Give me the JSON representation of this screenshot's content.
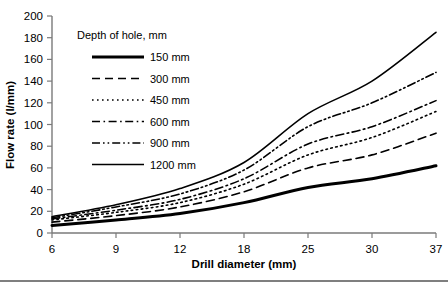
{
  "chart_data": {
    "type": "line",
    "title": "",
    "xlabel": "Drill diameter (mm)",
    "ylabel": "Flow rate (l/mm)",
    "x": [
      6,
      9,
      12,
      18,
      25,
      30,
      37
    ],
    "xtick_labels": [
      "6",
      "9",
      "12",
      "18",
      "25",
      "30",
      "37"
    ],
    "ytick_labels": [
      "0",
      "20",
      "40",
      "60",
      "80",
      "100",
      "120",
      "140",
      "160",
      "180",
      "200"
    ],
    "ylim": [
      0,
      200
    ],
    "ytick_step": 20,
    "grid": false,
    "legend_position": "upper-left-inside",
    "legend_title": "Depth of hole, mm",
    "series": [
      {
        "name": "150 mm",
        "label": "150 mm",
        "style": "solid-thick",
        "values": [
          7,
          12,
          18,
          28,
          42,
          50,
          62
        ]
      },
      {
        "name": "300 mm",
        "label": "300 mm",
        "style": "dashed",
        "values": [
          10,
          16,
          24,
          38,
          60,
          72,
          92
        ]
      },
      {
        "name": "450 mm",
        "label": "450 mm",
        "style": "dotted",
        "values": [
          12,
          19,
          28,
          45,
          72,
          88,
          112
        ]
      },
      {
        "name": "600 mm",
        "label": "600 mm",
        "style": "dash-dot",
        "values": [
          13,
          21,
          31,
          50,
          82,
          98,
          122
        ]
      },
      {
        "name": "900 mm",
        "label": "900 mm",
        "style": "dash-dot-dot",
        "values": [
          14,
          24,
          36,
          58,
          98,
          120,
          148
        ]
      },
      {
        "name": "1200 mm",
        "label": "1200 mm",
        "style": "solid-thin",
        "values": [
          15,
          26,
          41,
          65,
          110,
          140,
          185
        ]
      }
    ]
  },
  "axes": {
    "x_title": "Drill diameter (mm)",
    "y_title": "Flow rate (l/mm)"
  },
  "legend": {
    "title": "Depth of hole, mm",
    "entries": [
      {
        "label": "150 mm"
      },
      {
        "label": "300 mm"
      },
      {
        "label": "450 mm"
      },
      {
        "label": "600 mm"
      },
      {
        "label": "900 mm"
      },
      {
        "label": "1200 mm"
      }
    ]
  }
}
